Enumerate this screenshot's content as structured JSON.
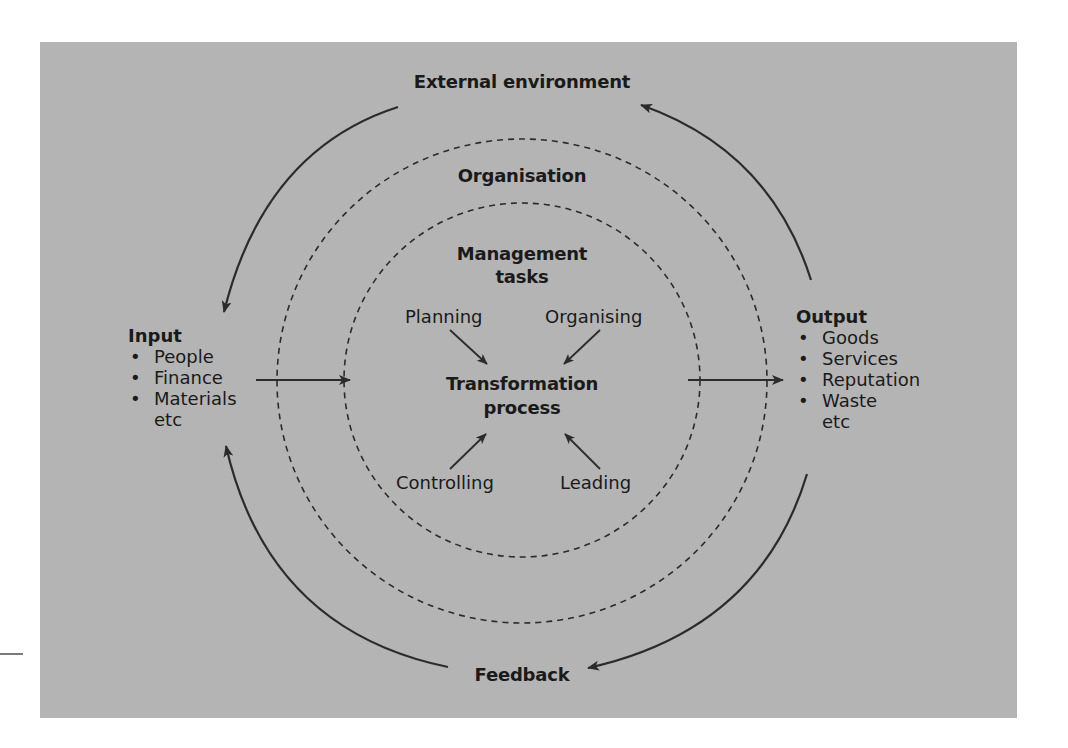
{
  "diagram": {
    "colors": {
      "panel_background": "#b4b4b4",
      "page_background": "#ffffff",
      "line": "#2b2b2b",
      "text": "#1a1a1a"
    },
    "outer_label": "External environment",
    "feedback_label": "Feedback",
    "organisation_label": "Organisation",
    "management_tasks": {
      "line1": "Management",
      "line2": "tasks"
    },
    "transformation": {
      "line1": "Transformation",
      "line2": "process"
    },
    "tasks": [
      {
        "label": "Planning",
        "position": "top-left"
      },
      {
        "label": "Organising",
        "position": "top-right"
      },
      {
        "label": "Controlling",
        "position": "bottom-left"
      },
      {
        "label": "Leading",
        "position": "bottom-right"
      }
    ],
    "input": {
      "title": "Input",
      "bullet": "•",
      "items": [
        "People",
        "Finance",
        "Materials"
      ],
      "suffix": "etc"
    },
    "output": {
      "title": "Output",
      "bullet": "•",
      "items": [
        "Goods",
        "Services",
        "Reputation",
        "Waste"
      ],
      "suffix": "etc"
    },
    "flows": [
      {
        "from": "External environment",
        "to": "Input",
        "kind": "curved-arrow"
      },
      {
        "from": "Output",
        "to": "External environment",
        "kind": "curved-arrow"
      },
      {
        "from": "Output",
        "to": "Feedback",
        "kind": "curved-arrow"
      },
      {
        "from": "Feedback",
        "to": "Input",
        "kind": "curved-arrow"
      },
      {
        "from": "Input",
        "to": "Transformation process",
        "kind": "straight-arrow"
      },
      {
        "from": "Transformation process",
        "to": "Output",
        "kind": "straight-arrow"
      },
      {
        "from": "Planning",
        "to": "Transformation process",
        "kind": "straight-arrow"
      },
      {
        "from": "Organising",
        "to": "Transformation process",
        "kind": "straight-arrow"
      },
      {
        "from": "Controlling",
        "to": "Transformation process",
        "kind": "straight-arrow"
      },
      {
        "from": "Leading",
        "to": "Transformation process",
        "kind": "straight-arrow"
      }
    ],
    "boundaries": [
      {
        "name": "Organisation",
        "style": "dashed-circle"
      },
      {
        "name": "Management tasks",
        "style": "dashed-circle"
      }
    ]
  }
}
